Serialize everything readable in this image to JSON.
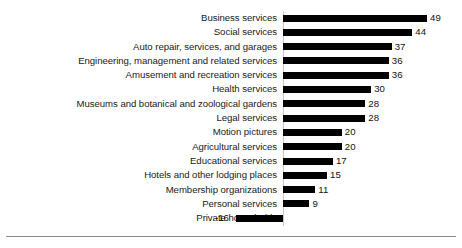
{
  "chart_data": {
    "type": "bar",
    "orientation": "horizontal",
    "title": "",
    "subtitle": "",
    "xlabel": "",
    "ylabel": "",
    "grid": false,
    "legend": null,
    "xlim": [
      -16,
      49
    ],
    "zero_line": true,
    "bar_color": "#000000",
    "categories": [
      "Business services",
      "Social services",
      "Auto repair, services, and garages",
      "Engineering, management and related services",
      "Amusement and recreation services",
      "Health services",
      "Museums and botanical and zoological gardens",
      "Legal services",
      "Motion pictures",
      "Agricultural services",
      "Educational services",
      "Hotels and other lodging places",
      "Membership organizations",
      "Personal services",
      "Private households"
    ],
    "values": [
      49,
      44,
      37,
      36,
      36,
      30,
      28,
      28,
      20,
      20,
      17,
      15,
      11,
      9,
      -16
    ],
    "value_labels": [
      "49",
      "44",
      "37",
      "36",
      "36",
      "30",
      "28",
      "28",
      "20",
      "20",
      "17",
      "15",
      "11",
      "9",
      "-16"
    ]
  }
}
